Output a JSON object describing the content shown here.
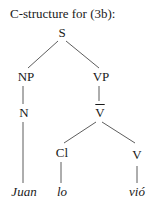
{
  "title": "C-structure for (3b):",
  "tree": {
    "nodes": {
      "S": {
        "label": "S",
        "x": 62,
        "y": 33
      },
      "NP": {
        "label": "NP",
        "x": 26,
        "y": 77
      },
      "VP": {
        "label": "VP",
        "x": 101,
        "y": 77
      },
      "N": {
        "label": "N",
        "x": 26,
        "y": 113
      },
      "Vbar": {
        "label": "V",
        "x": 101,
        "y": 113,
        "bar": true
      },
      "Cl": {
        "label": "Cl",
        "x": 63,
        "y": 153
      },
      "V": {
        "label": "V",
        "x": 137,
        "y": 153
      },
      "Juan": {
        "label": "Juan",
        "x": 24,
        "y": 192,
        "leaf": true
      },
      "lo": {
        "label": "lo",
        "x": 63,
        "y": 192,
        "leaf": true
      },
      "vio": {
        "label": "vió",
        "x": 137,
        "y": 192,
        "leaf": true
      }
    },
    "edges": [
      [
        "S",
        "NP"
      ],
      [
        "S",
        "VP"
      ],
      [
        "NP",
        "N"
      ],
      [
        "VP",
        "Vbar"
      ],
      [
        "Vbar",
        "Cl"
      ],
      [
        "Vbar",
        "V"
      ],
      [
        "N",
        "Juan"
      ],
      [
        "Cl",
        "lo"
      ],
      [
        "V",
        "vio"
      ]
    ]
  }
}
